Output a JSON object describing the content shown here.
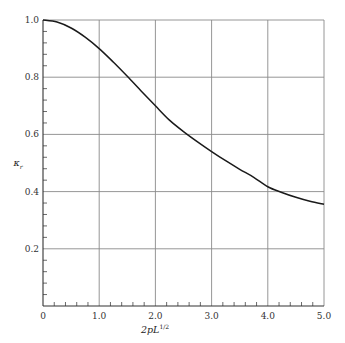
{
  "chart_data": {
    "type": "line",
    "title": "",
    "xlabel": "2pL^{1/2}",
    "xlabel_main": "2pL",
    "xlabel_sup": "1/2",
    "ylabel": "κ_r",
    "ylabel_main": "κ",
    "ylabel_sub": "r",
    "xlim": [
      0,
      5.0
    ],
    "ylim": [
      0,
      1.0
    ],
    "grid": true,
    "legend": null,
    "x_ticks": [
      "0",
      "1.0",
      "2.0",
      "3.0",
      "4.0",
      "5.0"
    ],
    "y_ticks": [
      "0.2",
      "0.4",
      "0.6",
      "0.8",
      "1.0"
    ],
    "x_minor_step": 0.2,
    "y_minor_step": 0.04,
    "series": [
      {
        "name": "κ_r",
        "x": [
          0,
          0.25,
          0.5,
          0.75,
          1.0,
          1.25,
          1.5,
          1.75,
          2.0,
          2.25,
          2.5,
          2.75,
          3.0,
          3.25,
          3.5,
          3.75,
          4.0,
          4.25,
          4.5,
          4.75,
          5.0
        ],
        "values": [
          1.0,
          0.993,
          0.972,
          0.94,
          0.9,
          0.853,
          0.803,
          0.751,
          0.7,
          0.65,
          0.61,
          0.574,
          0.54,
          0.508,
          0.478,
          0.45,
          0.417,
          0.397,
          0.38,
          0.366,
          0.356
        ]
      }
    ]
  }
}
